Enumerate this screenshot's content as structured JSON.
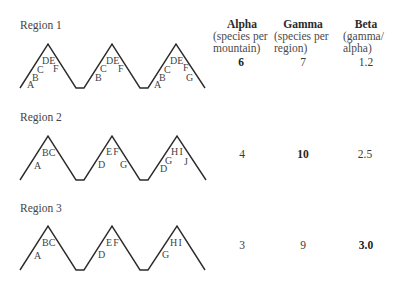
{
  "table": {
    "columns": [
      {
        "title": "Alpha",
        "sub1": "(species per",
        "sub2": "mountain)"
      },
      {
        "title": "Gamma",
        "sub1": "(species per",
        "sub2": "region)"
      },
      {
        "title": "Beta",
        "sub1": "(gamma/",
        "sub2": "alpha)"
      }
    ]
  },
  "regions": [
    {
      "name": "Region 1",
      "alpha": "6",
      "gamma": "7",
      "beta": "1.2",
      "highlight": "alpha",
      "mountains": [
        {
          "labels": [
            "A",
            "B",
            "C",
            "DE",
            "F"
          ]
        },
        {
          "labels": [
            "B",
            "C",
            "DE",
            "F"
          ]
        },
        {
          "labels": [
            "A",
            "B",
            "C",
            "DE",
            "F",
            "G"
          ]
        }
      ]
    },
    {
      "name": "Region 2",
      "alpha": "4",
      "gamma": "10",
      "beta": "2.5",
      "highlight": "gamma",
      "mountains": [
        {
          "labels": [
            "A",
            "BC"
          ]
        },
        {
          "labels": [
            "D",
            "EF",
            "G"
          ]
        },
        {
          "labels": [
            "D",
            "G",
            "HI",
            "J"
          ]
        }
      ]
    },
    {
      "name": "Region 3",
      "alpha": "3",
      "gamma": "9",
      "beta": "3.0",
      "highlight": "beta",
      "mountains": [
        {
          "labels": [
            "A",
            "BC"
          ]
        },
        {
          "labels": [
            "D",
            "EF"
          ]
        },
        {
          "labels": [
            "G",
            "HI"
          ]
        }
      ]
    }
  ],
  "colors": {
    "line": "#2b2b2b",
    "text": "#3a3a3a",
    "background": "#ffffff"
  }
}
